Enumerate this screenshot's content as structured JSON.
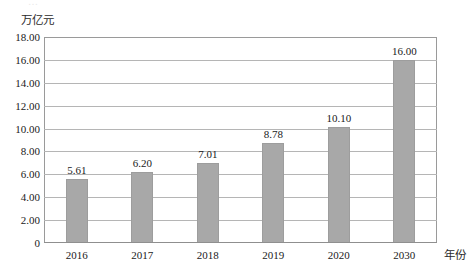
{
  "chart_data": {
    "type": "bar",
    "title": "",
    "subtitle": "",
    "xlabel": "年份",
    "ylabel": "万亿元",
    "categories": [
      "2016",
      "2017",
      "2018",
      "2019",
      "2020",
      "2030"
    ],
    "values": [
      5.61,
      6.2,
      7.01,
      8.78,
      10.1,
      16.0
    ],
    "value_labels": [
      "5.61",
      "6.20",
      "7.01",
      "8.78",
      "10.10",
      "16.00"
    ],
    "series": [
      {
        "name": "",
        "values": [
          5.61,
          6.2,
          7.01,
          8.78,
          10.1,
          16.0
        ],
        "color": "#a8a8a8"
      }
    ],
    "ylim": [
      0,
      18
    ],
    "ytick_step": 2,
    "ytick_labels": [
      "0",
      "2.00",
      "4.00",
      "6.00",
      "8.00",
      "10.00",
      "12.00",
      "14.00",
      "16.00",
      "18.00"
    ],
    "ytick_values": [
      0,
      2,
      4,
      6,
      8,
      10,
      12,
      14,
      16,
      18
    ],
    "grid": true,
    "grid_axis": "y",
    "legend": false,
    "legend_position": "none",
    "data_labels_shown": true
  },
  "style": {
    "bar_color": "#a8a8a8",
    "bar_border_color": "#9d9d9d",
    "gridline_color": "#b5b5b5",
    "frame_color": "#9a9a9a",
    "text_color": "#1a1a1a",
    "background": "#ffffff"
  },
  "artifact": {
    "top_fragment": "…"
  }
}
